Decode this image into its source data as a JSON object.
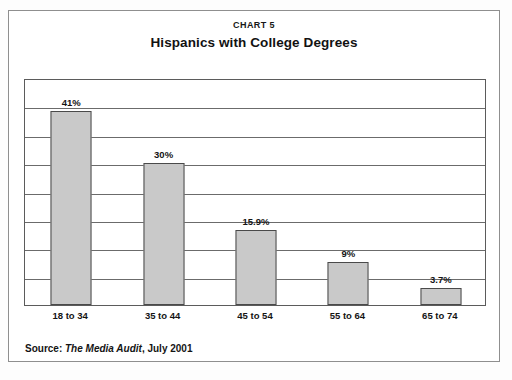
{
  "card": {
    "chart_label": "CHART 5",
    "title": "Hispanics with College Degrees",
    "source_prefix": "Source:",
    "source_publication": "The Media Audit",
    "source_suffix": ", July 2001"
  },
  "colors": {
    "bar_fill": "#c9c9c9",
    "bar_border": "#4a4a4a",
    "gridline": "#6b6b6b",
    "plot_border": "#5b5b5b",
    "card_border": "#8f8f8f",
    "background": "#ffffff",
    "text": "#141414"
  },
  "chart_data": {
    "type": "bar",
    "title": "Hispanics with College Degrees",
    "subtitle": "CHART 5",
    "xlabel": "",
    "ylabel": "",
    "categories": [
      "18 to 34",
      "35 to 44",
      "45 to 54",
      "55 to 64",
      "65 to 74"
    ],
    "values": [
      41,
      30,
      15.9,
      9,
      3.7
    ],
    "value_labels": [
      "41%",
      "30%",
      "15.9%",
      "9%",
      "3.7%"
    ],
    "ylim": [
      0,
      48
    ],
    "grid": true,
    "gridline_count": 8,
    "legend": "none",
    "source": "Source: The Media Audit, July 2001"
  }
}
